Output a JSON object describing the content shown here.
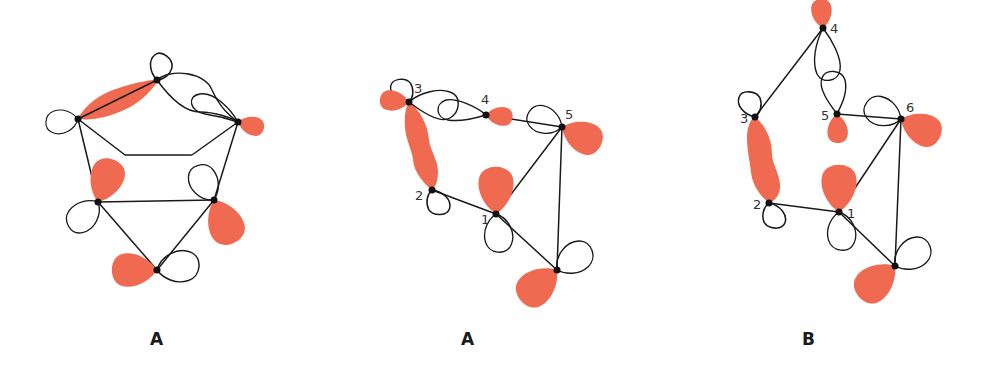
{
  "figure": {
    "orbital_color": "#ef6a50",
    "line_color": "#1a1a1a",
    "panels": [
      {
        "id": "panel-1",
        "label": "A",
        "label_pos": [
          150,
          341
        ],
        "atoms": [
          {
            "id": "a",
            "x": 78,
            "y": 119,
            "num": ""
          },
          {
            "id": "b",
            "x": 157,
            "y": 80,
            "num": ""
          },
          {
            "id": "c",
            "x": 238,
            "y": 122,
            "num": ""
          },
          {
            "id": "d",
            "x": 98,
            "y": 202,
            "num": ""
          },
          {
            "id": "e",
            "x": 214,
            "y": 200,
            "num": ""
          },
          {
            "id": "f",
            "x": 157,
            "y": 270,
            "num": ""
          }
        ]
      },
      {
        "id": "panel-2",
        "label": "A",
        "label_pos": [
          461,
          341
        ],
        "atoms": [
          {
            "id": "3",
            "x": 409,
            "y": 102,
            "num": "3"
          },
          {
            "id": "4",
            "x": 486,
            "y": 115,
            "num": "4"
          },
          {
            "id": "5",
            "x": 562,
            "y": 127,
            "num": "5"
          },
          {
            "id": "2",
            "x": 432,
            "y": 190,
            "num": "2"
          },
          {
            "id": "1",
            "x": 496,
            "y": 214,
            "num": "1"
          },
          {
            "id": "6",
            "x": 557,
            "y": 270,
            "num": ""
          }
        ]
      },
      {
        "id": "panel-3",
        "label": "B",
        "label_pos": [
          802,
          341
        ],
        "atoms": [
          {
            "id": "4",
            "x": 823,
            "y": 28,
            "num": "4"
          },
          {
            "id": "3",
            "x": 755,
            "y": 117,
            "num": "3"
          },
          {
            "id": "5",
            "x": 837,
            "y": 114,
            "num": "5"
          },
          {
            "id": "6",
            "x": 901,
            "y": 119,
            "num": "6"
          },
          {
            "id": "2",
            "x": 769,
            "y": 203,
            "num": "2"
          },
          {
            "id": "1",
            "x": 839,
            "y": 212,
            "num": "1"
          },
          {
            "id": "7",
            "x": 895,
            "y": 266,
            "num": ""
          }
        ]
      }
    ]
  },
  "labels": {
    "panel_1": "A",
    "panel_2": "A",
    "panel_3": "B",
    "p2_atom_1": "1",
    "p2_atom_2": "2",
    "p2_atom_3": "3",
    "p2_atom_4": "4",
    "p2_atom_5": "5",
    "p3_atom_1": "1",
    "p3_atom_2": "2",
    "p3_atom_3": "3",
    "p3_atom_4": "4",
    "p3_atom_5": "5",
    "p3_atom_6": "6"
  }
}
